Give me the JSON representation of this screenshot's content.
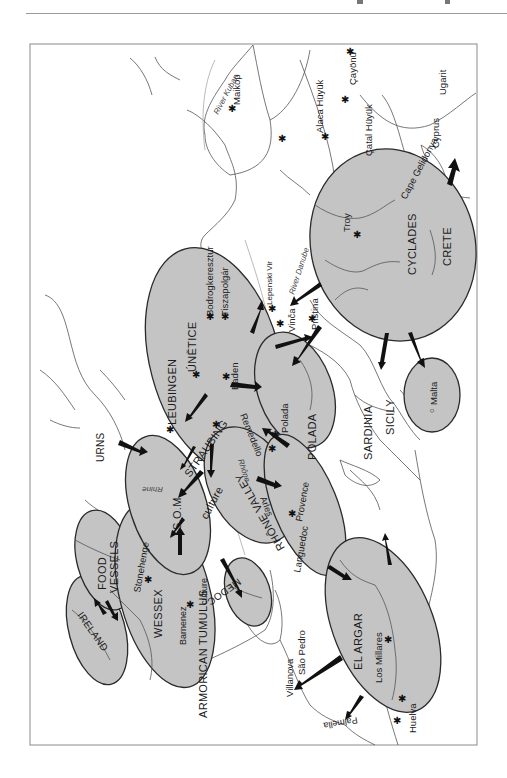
{
  "map": {
    "orientation": "rotated 90 degrees clockwise (text reads bottom-to-top)",
    "colors": {
      "culture_zone_fill": "#c4c4c4",
      "culture_zone_outline": "#2a2a2a",
      "coastline": "#555555",
      "rivers": "#a8a8a8",
      "arrows": "#111111",
      "background": "#ffffff"
    },
    "culture_zones": [
      {
        "id": "ireland",
        "label": "IRELAND"
      },
      {
        "id": "food-vessels",
        "label": "FOOD VESSELS"
      },
      {
        "id": "wessex",
        "label": "WESSEX"
      },
      {
        "id": "armorican-tumulus",
        "label": "ARMORICAN TUMULUS culture"
      },
      {
        "id": "som",
        "label": "S.O.M."
      },
      {
        "id": "medoc",
        "label": "MEDOC"
      },
      {
        "id": "leubingen",
        "label": "LEUBINGEN"
      },
      {
        "id": "unetice",
        "label": "ÚNĚTICE"
      },
      {
        "id": "straubing",
        "label": "STRAUBING"
      },
      {
        "id": "rhone-valley",
        "label": "RHÔNE VALLEY culture"
      },
      {
        "id": "polada",
        "label": "POLADA"
      },
      {
        "id": "el-argar",
        "label": "EL ARGAR"
      },
      {
        "id": "cyclades",
        "label": "CYCLADES"
      },
      {
        "id": "crete",
        "label": "CRETE"
      },
      {
        "id": "malta",
        "label": "Malta"
      }
    ],
    "region_labels": [
      "URNS",
      "SARDINIA",
      "SICILY",
      "Cyprus",
      "Languedoc",
      "Provence"
    ],
    "sites": [
      "Stonehenge",
      "Barnenez",
      "Baden",
      "Remedello",
      "Polada",
      "Arles",
      "Bodrogkeresztur",
      "Tiszapolgár",
      "Lepenski Vir",
      "Vinča",
      "Pristina",
      "Troy",
      "Maikop",
      "Alaca Hüyük",
      "Çayönü",
      "Çatal Hüyük",
      "Ugarit",
      "Cape Gelidonya",
      "Los Millares",
      "Huelva",
      "Palmella",
      "Villanova",
      "São Pedro"
    ],
    "rivers": [
      "Rhine",
      "Rhône",
      "River Danube",
      "River Kuban"
    ],
    "labels": {
      "ireland": "IRELAND",
      "food": "FOOD",
      "vessels": "VESSELS",
      "wessex": "WESSEX",
      "stonehenge": "Stonehenge",
      "barnenez": "Barnenez",
      "armorican": "ARMORICAN TUMULUS",
      "armorican_culture": "culture",
      "som": "S.O.M.",
      "medoc": "MEDOC",
      "urns": "URNS",
      "leubingen": "LEUBINGEN",
      "unetice": "ÚNĚTICE",
      "straubing": "STRAUBING",
      "baden": "Baden",
      "remedello": "Remedello",
      "rhone_valley": "RHÔNE VALLEY",
      "rhone_culture": "culture",
      "arles": "Arles",
      "languedoc": "Languedoc",
      "provence": "Provence",
      "polada_zone": "POLADA",
      "polada_site": "Polada",
      "rhine": "Rhine",
      "rhone_river": "Rhône",
      "bodrog": "Bodrogkeresztur",
      "tisza": "Tiszapolgár",
      "lepenski": "Lepenski Vir",
      "danube": "River Danube",
      "vinca": "Vinča",
      "pristina": "Pristina",
      "troy": "Troy",
      "cyclades": "CYCLADES",
      "crete": "CRETE",
      "sardinia": "SARDINIA",
      "sicily": "SICILY",
      "malta": "Malta",
      "maikop": "Maikop",
      "kuban": "River Kuban",
      "alaca": "Alaca Hüyük",
      "cayonu": "Çayönü",
      "catal": "Çatal Hüyük",
      "ugarit": "Ugarit",
      "cyprus": "Cyprus",
      "gelidonya": "Cape Gelidonya",
      "el_argar": "EL ARGAR",
      "los_millares": "Los Millares",
      "huelva": "Huelva",
      "palmella": "Palmella",
      "villanova": "Villanova",
      "sao_pedro": "São Pedro"
    }
  }
}
